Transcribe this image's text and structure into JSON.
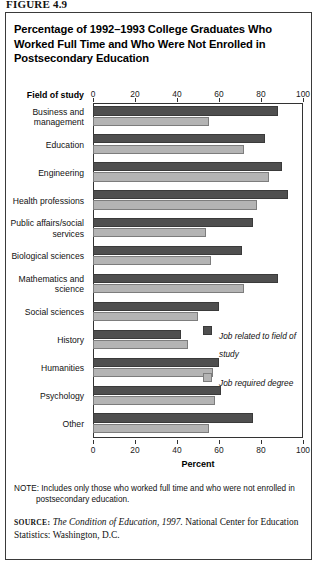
{
  "figure": {
    "label": "FIGURE 4.9",
    "title": "Percentage of 1992–1993 College Graduates Who Worked Full Time and Who Were Not Enrolled in Postsecondary Education"
  },
  "axis": {
    "category_header": "Field of study",
    "xlabel": "Percent",
    "ticks": [
      "0",
      "20",
      "40",
      "60",
      "80",
      "100"
    ]
  },
  "legend": {
    "items": [
      {
        "label": "Job related to field of study",
        "color": "#4f4f4f"
      },
      {
        "label": "Job required degree",
        "color": "#b4b4b4"
      }
    ]
  },
  "footnotes": {
    "note_label": "NOTE:",
    "note_line1": " Includes only those who worked full time and who were not enrolled in",
    "note_line2": "postsecondary education.",
    "source_label": "SOURCE:",
    "source_italic": " The Condition of Education, 1997.",
    "source_rest": "  National Center for Education Statistics: Washington, D.C."
  },
  "chart_data": {
    "type": "bar",
    "orientation": "horizontal",
    "title": "Percentage of 1992–1993 College Graduates Who Worked Full Time and Who Were Not Enrolled in Postsecondary Education",
    "xlabel": "Percent",
    "ylabel": "Field of study",
    "xlim": [
      0,
      100
    ],
    "xticks": [
      0,
      20,
      40,
      60,
      80,
      100
    ],
    "grid": false,
    "legend_position": "inside-right",
    "categories": [
      "Business and management",
      "Education",
      "Engineering",
      "Health professions",
      "Public affairs/social services",
      "Biological sciences",
      "Mathematics and science",
      "Social sciences",
      "History",
      "Humanities",
      "Psychology",
      "Other"
    ],
    "series": [
      {
        "name": "Job related to field of study",
        "color": "#4f4f4f",
        "values": [
          88,
          82,
          90,
          93,
          76,
          71,
          88,
          60,
          42,
          60,
          61,
          76
        ]
      },
      {
        "name": "Job required degree",
        "color": "#b4b4b4",
        "values": [
          55,
          72,
          84,
          78,
          54,
          56,
          72,
          50,
          45,
          57,
          58,
          55
        ]
      }
    ]
  },
  "category_lines": [
    [
      "Business and",
      "management"
    ],
    [
      "Education"
    ],
    [
      "Engineering"
    ],
    [
      "Health professions"
    ],
    [
      "Public affairs/social",
      "services"
    ],
    [
      "Biological sciences"
    ],
    [
      "Mathematics and",
      "science"
    ],
    [
      "Social sciences"
    ],
    [
      "History"
    ],
    [
      "Humanities"
    ],
    [
      "Psychology"
    ],
    [
      "Other"
    ]
  ]
}
